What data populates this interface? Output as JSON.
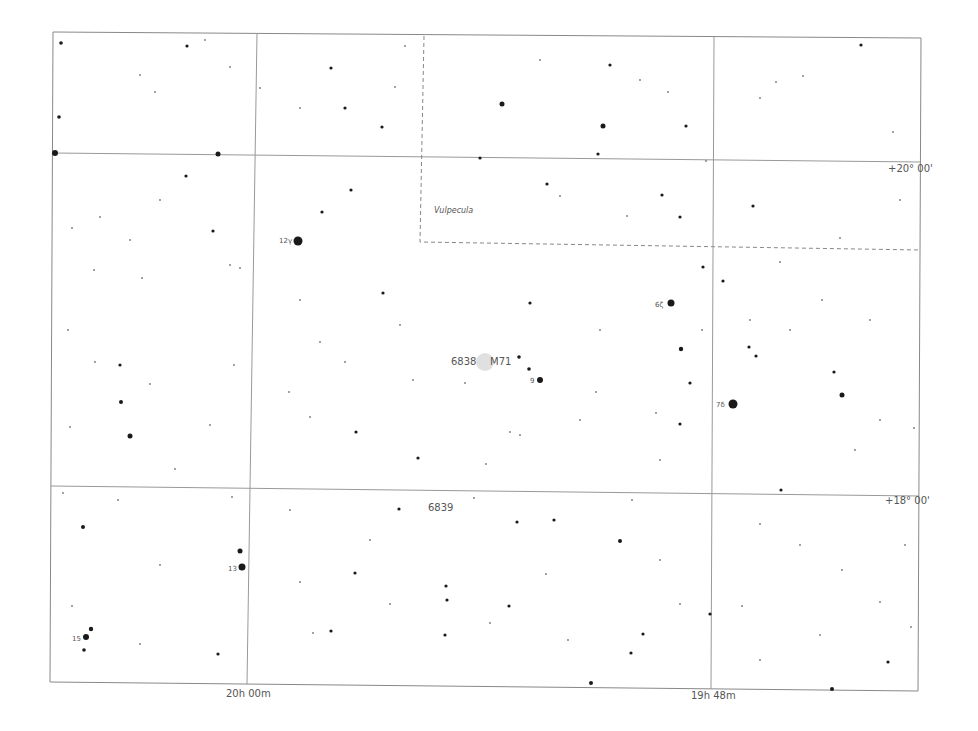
{
  "map": {
    "type": "star-chart",
    "constellation_label": "Vulpecula",
    "axes": {
      "ra_labels": [
        {
          "text": "20h 00m",
          "x": 246,
          "y": 693
        },
        {
          "text": "19h 48m",
          "x": 712,
          "y": 695
        }
      ],
      "dec_labels": [
        {
          "text": "+20° 00'",
          "x": 908,
          "y": 168
        },
        {
          "text": "+18° 00'",
          "x": 905,
          "y": 500
        }
      ]
    },
    "objects": [
      {
        "label": "6838",
        "x": 464,
        "y": 362
      },
      {
        "label": "M71",
        "x": 499,
        "y": 362
      },
      {
        "label": "6839",
        "x": 441,
        "y": 508
      }
    ],
    "star_labels": [
      {
        "text": "12γ",
        "x": 286,
        "y": 242
      },
      {
        "text": "6ζ",
        "x": 661,
        "y": 307
      },
      {
        "text": "7δ",
        "x": 722,
        "y": 406
      },
      {
        "text": "9",
        "x": 533,
        "y": 382
      },
      {
        "text": "13",
        "x": 233,
        "y": 570
      },
      {
        "text": "15",
        "x": 77,
        "y": 640
      }
    ],
    "colors": {
      "background": "#ffffff",
      "grid": "#888888",
      "stars": "#1a1a1a",
      "labels": "#555555",
      "cluster": "#dddddd"
    }
  }
}
